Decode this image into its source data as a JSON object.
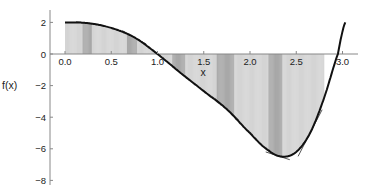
{
  "chart_data": {
    "type": "line",
    "title": "",
    "xlabel": "x",
    "ylabel": "f(x)",
    "xlim": [
      -0.15,
      3.2
    ],
    "ylim": [
      -8,
      2.5
    ],
    "x_ticks": [
      "0.0",
      "0.5",
      "1.0",
      "1.5",
      "2.0",
      "2.5",
      "3.0"
    ],
    "y_ticks": [
      "2",
      "0",
      "-2",
      "-4",
      "-6",
      "-8"
    ],
    "grid": false,
    "legend": null,
    "series": [
      {
        "name": "f(x)",
        "x": [
          0.0,
          0.25,
          0.5,
          0.75,
          1.0,
          1.25,
          1.5,
          1.75,
          2.0,
          2.2,
          2.35,
          2.5,
          2.65,
          2.8,
          2.95,
          3.03
        ],
        "values": [
          2.0,
          1.95,
          1.65,
          1.05,
          0.0,
          -1.2,
          -2.35,
          -3.5,
          -5.0,
          -6.1,
          -6.5,
          -6.2,
          -5.0,
          -2.8,
          0.0,
          2.0
        ]
      }
    ],
    "shaded_region": {
      "description": "Region between x-axis and tangent-line envelope, split into vertical strips with alternating light/dark gray bands",
      "x_range": [
        0.0,
        2.8
      ],
      "dark_bands": [
        [
          0.19,
          0.29
        ],
        [
          0.67,
          0.78
        ],
        [
          1.16,
          1.3
        ],
        [
          1.64,
          1.83
        ],
        [
          2.2,
          2.35
        ]
      ]
    },
    "tangent_points": [
      0.25,
      0.75,
      1.2,
      1.75,
      2.3,
      2.65
    ]
  },
  "colors": {
    "curve": "#111111",
    "axis": "#888888",
    "fill_light": "#d4d4d4",
    "fill_dark": "#a8a8a8",
    "tangent": "#555555"
  }
}
